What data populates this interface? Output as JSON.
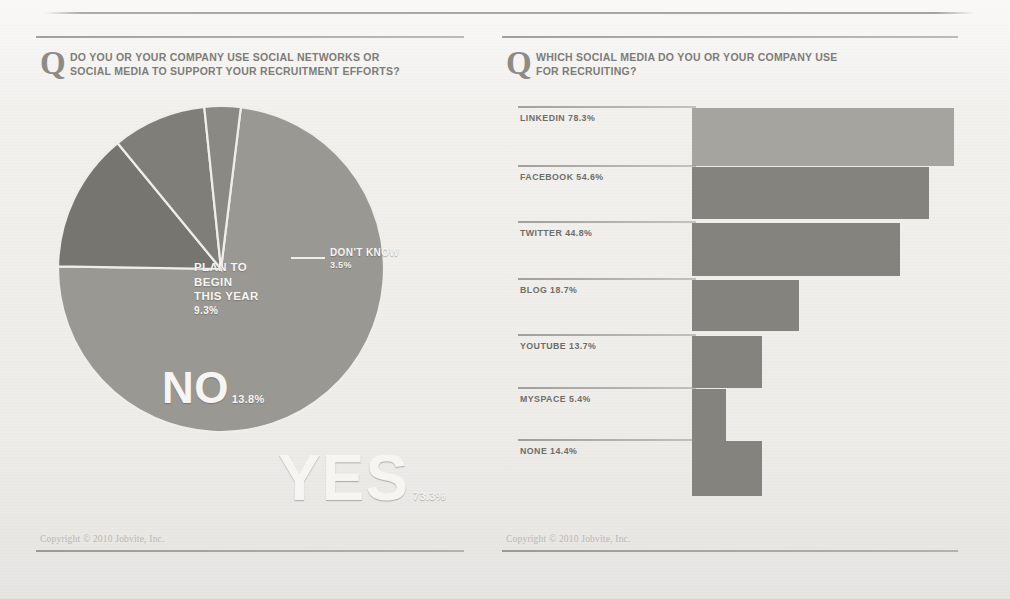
{
  "footer_text": "Copyright © 2010 Jobvite, Inc.",
  "q_glyph": "Q",
  "left_panel": {
    "question_line1": "DO YOU OR YOUR COMPANY USE SOCIAL NETWORKS OR",
    "question_line2": "SOCIAL MEDIA TO SUPPORT YOUR RECRUITMENT EFFORTS?",
    "labels": {
      "yes": "YES",
      "yes_pct": "73.3%",
      "no": "NO",
      "no_pct": "13.8%",
      "plan_l1": "PLAN TO",
      "plan_l2": "BEGIN",
      "plan_l3": "THIS YEAR",
      "plan_pct": "9.3%",
      "dont_know": "DON'T KNOW",
      "dont_know_pct": "3.5%"
    }
  },
  "right_panel": {
    "question_line1": "WHICH SOCIAL MEDIA DO YOU OR YOUR COMPANY USE",
    "question_line2": "FOR RECRUITING?"
  },
  "chart_data": [
    {
      "type": "pie",
      "title": "DO YOU OR YOUR COMPANY USE SOCIAL NETWORKS OR SOCIAL MEDIA TO SUPPORT YOUR RECRUITMENT EFFORTS?",
      "unit": "percent",
      "legend": "in-slice labels",
      "slices": [
        {
          "label": "YES",
          "value": 73.3,
          "display": "73.3%",
          "color": "#9a9893",
          "start_deg": 7,
          "end_deg": 270.9
        },
        {
          "label": "NO",
          "value": 13.8,
          "display": "13.8%",
          "color": "#77756f",
          "start_deg": 270.9,
          "end_deg": 320.6
        },
        {
          "label": "PLAN TO BEGIN THIS YEAR",
          "value": 9.3,
          "display": "9.3%",
          "color": "#807e79",
          "start_deg": 320.6,
          "end_deg": 354.1
        },
        {
          "label": "DON'T KNOW",
          "value": 3.5,
          "display": "3.5%",
          "color": "#8b8984",
          "start_deg": 354.1,
          "end_deg": 7
        }
      ]
    },
    {
      "type": "bar",
      "orientation": "horizontal",
      "title": "WHICH SOCIAL MEDIA DO YOU OR YOUR COMPANY USE FOR RECRUITING?",
      "unit": "percent",
      "xlabel": "",
      "ylabel": "",
      "grid": false,
      "categories": [
        "LINKEDIN",
        "FACEBOOK",
        "TWITTER",
        "BLOG",
        "YOUTUBE",
        "MYSPACE",
        "NONE"
      ],
      "values": [
        78.3,
        54.6,
        44.8,
        18.7,
        13.7,
        5.4,
        14.4
      ],
      "bars": [
        {
          "label": "LINKEDIN",
          "value": 78.3,
          "display": "LINKEDIN 78.3%",
          "color": "#a6a49f",
          "px_width": 262,
          "px_height": 58,
          "row_top": 12
        },
        {
          "label": "FACEBOOK",
          "value": 54.6,
          "display": "FACEBOOK 54.6%",
          "color": "#85837d",
          "px_width": 237,
          "px_height": 52,
          "row_top": 71
        },
        {
          "label": "TWITTER",
          "value": 44.8,
          "display": "TWITTER 44.8%",
          "color": "#85837d",
          "px_width": 208,
          "px_height": 53,
          "row_top": 127
        },
        {
          "label": "BLOG",
          "value": 18.7,
          "display": "BLOG 18.7%",
          "color": "#85837d",
          "px_width": 107,
          "px_height": 51,
          "row_top": 184
        },
        {
          "label": "YOUTUBE",
          "value": 13.7,
          "display": "YOUTUBE 13.7%",
          "color": "#85837d",
          "px_width": 70,
          "px_height": 52,
          "row_top": 240
        },
        {
          "label": "MYSPACE",
          "value": 5.4,
          "display": "MYSPACE 5.4%",
          "color": "#85837d",
          "px_width": 34,
          "px_height": 52,
          "row_top": 293
        },
        {
          "label": "NONE",
          "value": 14.4,
          "display": "NONE 14.4%",
          "color": "#85837d",
          "px_width": 70,
          "px_height": 55,
          "row_top": 345
        }
      ]
    }
  ]
}
